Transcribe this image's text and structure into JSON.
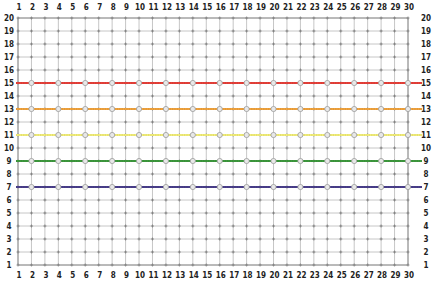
{
  "chart_data": {
    "type": "line",
    "title": "",
    "xlabel": "",
    "ylabel": "",
    "xlim": [
      1,
      30
    ],
    "ylim": [
      1,
      20
    ],
    "grid": true,
    "x_ticks": [
      1,
      2,
      3,
      4,
      5,
      6,
      7,
      8,
      9,
      10,
      11,
      12,
      13,
      14,
      15,
      16,
      17,
      18,
      19,
      20,
      21,
      22,
      23,
      24,
      25,
      26,
      27,
      28,
      29,
      30
    ],
    "y_ticks": [
      1,
      2,
      3,
      4,
      5,
      6,
      7,
      8,
      9,
      10,
      11,
      12,
      13,
      14,
      15,
      16,
      17,
      18,
      19,
      20
    ],
    "x_axis_positions": [
      "top",
      "bottom"
    ],
    "y_axis_positions": [
      "left",
      "right"
    ],
    "marker_x": [
      2,
      4,
      6,
      8,
      10,
      12,
      14,
      16,
      18,
      20,
      22,
      24,
      26,
      28,
      30
    ],
    "legend": null,
    "series": [
      {
        "name": "red",
        "color": "#e8413a",
        "values": [
          15,
          15,
          15,
          15,
          15,
          15,
          15,
          15,
          15,
          15,
          15,
          15,
          15,
          15,
          15,
          15,
          15,
          15,
          15,
          15,
          15,
          15,
          15,
          15,
          15,
          15,
          15,
          15,
          15,
          15
        ]
      },
      {
        "name": "orange",
        "color": "#f2a43e",
        "values": [
          13,
          13,
          13,
          13,
          13,
          13,
          13,
          13,
          13,
          13,
          13,
          13,
          13,
          13,
          13,
          13,
          13,
          13,
          13,
          13,
          13,
          13,
          13,
          13,
          13,
          13,
          13,
          13,
          13,
          13
        ]
      },
      {
        "name": "yellow",
        "color": "#f3ef7a",
        "values": [
          11,
          11,
          11,
          11,
          11,
          11,
          11,
          11,
          11,
          11,
          11,
          11,
          11,
          11,
          11,
          11,
          11,
          11,
          11,
          11,
          11,
          11,
          11,
          11,
          11,
          11,
          11,
          11,
          11,
          11
        ]
      },
      {
        "name": "green",
        "color": "#3e9a3e",
        "values": [
          9,
          9,
          9,
          9,
          9,
          9,
          9,
          9,
          9,
          9,
          9,
          9,
          9,
          9,
          9,
          9,
          9,
          9,
          9,
          9,
          9,
          9,
          9,
          9,
          9,
          9,
          9,
          9,
          9,
          9
        ]
      },
      {
        "name": "purple",
        "color": "#4a3f8c",
        "values": [
          7,
          7,
          7,
          7,
          7,
          7,
          7,
          7,
          7,
          7,
          7,
          7,
          7,
          7,
          7,
          7,
          7,
          7,
          7,
          7,
          7,
          7,
          7,
          7,
          7,
          7,
          7,
          7,
          7,
          7
        ]
      }
    ]
  },
  "caption": {
    "text": "",
    "color": "#f2ebb0"
  }
}
